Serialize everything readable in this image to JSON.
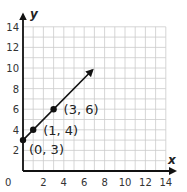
{
  "chart_data": {
    "type": "line",
    "title": "",
    "xlabel": "x",
    "ylabel": "y",
    "xlim": [
      0,
      14
    ],
    "ylim": [
      0,
      14
    ],
    "grid": true,
    "grid_minor_step": 1,
    "x_ticks": [
      0,
      2,
      4,
      6,
      8,
      10,
      12,
      14
    ],
    "y_ticks": [
      2,
      4,
      6,
      8,
      10,
      12,
      14
    ],
    "origin_label": "0",
    "points": [
      {
        "x": 0,
        "y": 3,
        "label": "(0, 3)"
      },
      {
        "x": 1,
        "y": 4,
        "label": "(1, 4)"
      },
      {
        "x": 3,
        "y": 6,
        "label": "(3, 6)"
      }
    ],
    "line": {
      "slope": 1,
      "intercept": 3,
      "x_start": 0,
      "x_end": 6.8,
      "arrow_end": true
    },
    "colors": {
      "grid": "#cccccc",
      "axis": "#111111",
      "line": "#111111",
      "point": "#111111"
    }
  }
}
